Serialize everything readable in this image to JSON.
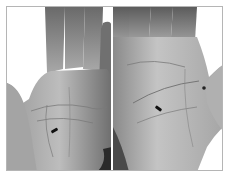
{
  "image": {
    "description": "Grayscale photograph of two open palms side by side, each with a small dark arrow marking a point on the palm",
    "panels": [
      {
        "id": "left",
        "subject": "left-palm",
        "marker": "arrow",
        "marker_position": {
          "x": 52,
          "y": 129
        }
      },
      {
        "id": "right",
        "subject": "right-palm",
        "marker": "arrow",
        "marker_position": {
          "x": 162,
          "y": 107
        }
      }
    ],
    "colors": {
      "skin_light": "#c8c8c8",
      "skin_mid": "#a0a0a0",
      "skin_dark": "#5a5a5a",
      "crease": "#7a7a7a",
      "marker": "#111111",
      "border": "#b5b5b5",
      "background": "#ffffff"
    }
  }
}
